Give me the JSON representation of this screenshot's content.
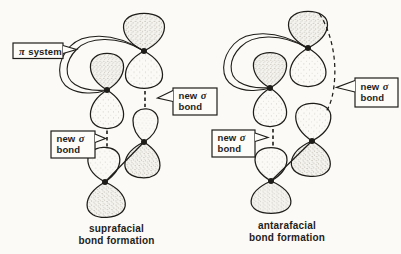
{
  "theme": {
    "paper": "#fbfaf6",
    "ink": "#1f1d1a",
    "box_fill": "#fdfcf9"
  },
  "pi_label": {
    "symbol": "π",
    "word": "system"
  },
  "sigma_label": {
    "word1": "new",
    "symbol": "σ",
    "word2": "bond"
  },
  "diagrams": {
    "left": {
      "caption_line1": "suprafacial",
      "caption_line2": "bond formation"
    },
    "right": {
      "caption_line1": "antarafacial",
      "caption_line2": "bond formation"
    }
  }
}
